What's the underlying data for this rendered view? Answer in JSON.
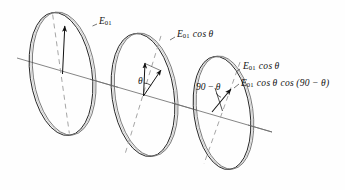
{
  "figure": {
    "background_color": "#fefefe",
    "ink_color": "#111111",
    "axis_color": "#6a6a6a",
    "dash_color": "#8c8c8c",
    "width": 345,
    "height": 190
  },
  "labels": {
    "e01": "E",
    "e01_sub": "01",
    "disc1_label_full": "E01",
    "disc2_label_full": "E01 cos θ",
    "disc3_label_a_full": "E01 cos θ",
    "disc3_label_b_full": "E01 cos θ cos (90 − θ)",
    "cos_theta": "cos θ",
    "cos_paren": "cos (90 − θ)",
    "theta": "θ",
    "ninety_minus_theta": "90 − θ"
  },
  "elements": {
    "disc1_name": "polarizer-disc-1",
    "disc2_name": "polarizer-disc-2",
    "disc3_name": "polarizer-disc-3",
    "axis_name": "optical-axis-line",
    "arrow1_name": "field-vector-e01",
    "arrow2_vertical_name": "field-vector-incident-disc2",
    "arrow2_tilted_name": "field-vector-transmitted-disc2",
    "arrow3_name": "field-vector-transmitted-disc3"
  },
  "geometry": {
    "disc1": {
      "cx": 61,
      "cy": 74,
      "rx": 31,
      "ry": 62,
      "rot": -8
    },
    "disc2": {
      "cx": 143,
      "cy": 95,
      "rx": 31,
      "ry": 62,
      "rot": -8
    },
    "disc3": {
      "cx": 222,
      "cy": 113,
      "rx": 28,
      "ry": 57,
      "rot": -8
    },
    "axis": {
      "x1": 17,
      "y1": 58,
      "x2": 272,
      "y2": 132
    },
    "theta_deg": 38,
    "ninety_minus_theta_deg": 52
  }
}
